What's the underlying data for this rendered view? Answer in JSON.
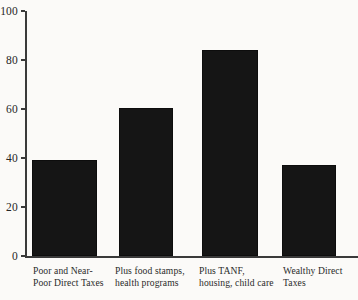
{
  "chart_data": {
    "type": "bar",
    "title": "",
    "subtitle": "",
    "xlabel": "",
    "ylabel": "",
    "categories": [
      "Poor and Near-\nPoor Direct Taxes",
      "Plus food stamps,\nhealth programs",
      "Plus TANF,\nhousing, child care",
      "Wealthy Direct\nTaxes"
    ],
    "values": [
      39,
      60.5,
      84,
      37
    ],
    "ylim": [
      0,
      100
    ],
    "yticks": [
      0,
      20,
      40,
      60,
      80,
      100
    ],
    "ytick_labels": [
      "0",
      "20",
      "40",
      "60",
      "80",
      "100"
    ],
    "grid": false,
    "legend": false,
    "bar_color": "#151515",
    "axis_color": "#3a3a3a",
    "background_color": "#fbfaf8"
  },
  "axis": {
    "ticks": [
      {
        "label": "100",
        "value": 100
      },
      {
        "label": "80",
        "value": 80
      },
      {
        "label": "60",
        "value": 60
      },
      {
        "label": "40",
        "value": 40
      },
      {
        "label": "20",
        "value": 20
      },
      {
        "label": "0",
        "value": 0
      }
    ]
  },
  "bars": [
    {
      "label": "Poor and Near-\nPoor Direct Taxes",
      "value": 39
    },
    {
      "label": "Plus food stamps,\nhealth programs",
      "value": 60.5
    },
    {
      "label": "Plus TANF,\nhousing, child care",
      "value": 84
    },
    {
      "label": "Wealthy Direct\nTaxes",
      "value": 37
    }
  ]
}
